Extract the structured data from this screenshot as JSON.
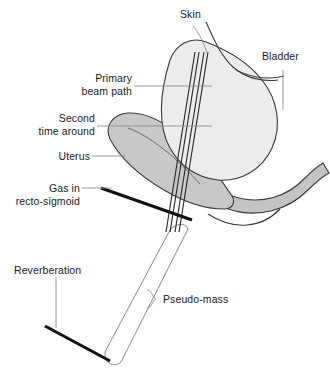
{
  "figure": {
    "type": "anatomical-ultrasound-artifact-diagram",
    "background": "#ffffff",
    "width": 330,
    "height": 383
  },
  "colors": {
    "outline": "#3a3a3a",
    "bladder_fill": "#ececec",
    "uterus_fill": "#c8c8c8",
    "rectum_fill": "#c4c4c4",
    "beam_line": "#2b2b2b",
    "leader_line": "#8c8c8c",
    "thick_black": "#111111",
    "text": "#1a1a1a",
    "pseudo_mass_fill": "#ffffff"
  },
  "labels": {
    "skin": "Skin",
    "bladder": "Bladder",
    "primary_beam_path_line1": "Primary",
    "primary_beam_path_line2": "beam path",
    "second_time_around_line1": "Second",
    "second_time_around_line2": "time around",
    "uterus": "Uterus",
    "gas_line1": "Gas in",
    "gas_line2": "recto-sigmoid",
    "reverberation": "Reverberation",
    "pseudo_mass": "Pseudo-mass"
  },
  "structures": [
    {
      "name": "bladder",
      "label": "Bladder",
      "fill": "#ececec"
    },
    {
      "name": "uterus",
      "label": "Uterus",
      "fill": "#c8c8c8"
    },
    {
      "name": "skin",
      "label": "Skin",
      "fill": "none"
    },
    {
      "name": "recto-sigmoid",
      "label": "Gas in recto-sigmoid",
      "fill": "#c4c4c4"
    },
    {
      "name": "pseudo-mass",
      "label": "Pseudo-mass",
      "fill": "#ffffff"
    },
    {
      "name": "reverberation",
      "label": "Reverberation",
      "fill": "#111111"
    },
    {
      "name": "primary-beam-path",
      "label": "Primary beam path",
      "fill": "none"
    },
    {
      "name": "second-time-around",
      "label": "Second time around",
      "fill": "none"
    }
  ]
}
